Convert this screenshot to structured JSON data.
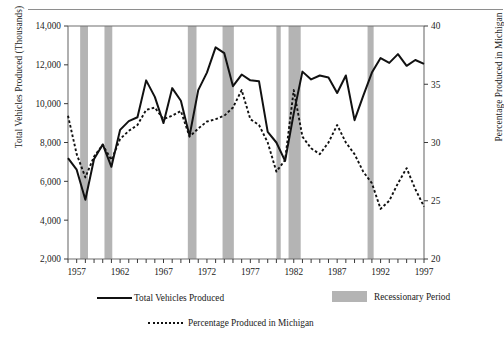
{
  "chart_data": {
    "type": "line",
    "title": "",
    "xlabel": "",
    "ylabel": "Total Vehicles Produced (Thousands)",
    "y2label": "Percentage Produced in Michigan",
    "x": [
      1956,
      1957,
      1958,
      1959,
      1960,
      1961,
      1962,
      1963,
      1964,
      1965,
      1966,
      1967,
      1968,
      1969,
      1970,
      1971,
      1972,
      1973,
      1974,
      1975,
      1976,
      1977,
      1978,
      1979,
      1980,
      1981,
      1982,
      1983,
      1984,
      1985,
      1986,
      1987,
      1988,
      1989,
      1990,
      1991,
      1992,
      1993,
      1994,
      1995,
      1996,
      1997
    ],
    "xlim": [
      1956,
      1997
    ],
    "ylim": [
      2000,
      14000
    ],
    "y2lim": [
      20,
      40
    ],
    "yticks": [
      "2,000",
      "4,000",
      "6,000",
      "8,000",
      "10,000",
      "12,000",
      "14,000"
    ],
    "y2ticks": [
      "20",
      "25",
      "30",
      "35",
      "40"
    ],
    "xticks_labeled": [
      "1957",
      "1962",
      "1967",
      "1972",
      "1977",
      "1982",
      "1987",
      "1992",
      "1997"
    ],
    "xtick_interval_years": 1,
    "grid": false,
    "legend_position": "below",
    "series": [
      {
        "name": "Total Vehicles Produced",
        "axis": "left",
        "style": "solid",
        "color": "#111111",
        "values": [
          7200,
          6600,
          5050,
          7150,
          7900,
          6750,
          8650,
          9100,
          9300,
          11200,
          10350,
          9000,
          10800,
          10150,
          8350,
          10700,
          11600,
          12900,
          12600,
          10900,
          11500,
          11200,
          11150,
          8550,
          8000,
          7050,
          9500,
          11650,
          11250,
          11450,
          11350,
          10550,
          11450,
          9150,
          10400,
          11600,
          12350,
          12100,
          12550,
          11950,
          12250,
          12050
        ],
        "values_description": "Total vehicles produced in thousands, 1956-1997"
      },
      {
        "name": "Percentage Produced in Michigan",
        "axis": "right",
        "style": "dotted",
        "color": "#111111",
        "values": [
          32.3,
          29.0,
          27.0,
          28.8,
          29.8,
          28.5,
          30.3,
          31.0,
          31.5,
          32.8,
          33.0,
          32.0,
          32.3,
          32.7,
          30.5,
          31.2,
          31.8,
          32.0,
          32.3,
          33.0,
          34.5,
          32.0,
          31.5,
          30.0,
          27.5,
          28.5,
          34.5,
          30.5,
          29.5,
          29.0,
          30.0,
          31.5,
          30.0,
          29.0,
          27.5,
          26.5,
          24.3,
          25.0,
          26.5,
          27.8,
          26.0,
          24.5
        ],
        "values_description": "Percentage of total vehicles produced in Michigan, 1956-1997"
      }
    ],
    "shaded_regions": {
      "name": "Recessionary Period",
      "color": "#b4b4b4",
      "periods": [
        {
          "start": 1957.4,
          "end": 1958.3
        },
        {
          "start": 1960.2,
          "end": 1961.1
        },
        {
          "start": 1969.8,
          "end": 1970.8
        },
        {
          "start": 1973.8,
          "end": 1975.1
        },
        {
          "start": 1980.0,
          "end": 1980.5
        },
        {
          "start": 1981.4,
          "end": 1982.8
        },
        {
          "start": 1990.5,
          "end": 1991.2
        }
      ]
    }
  },
  "legend": {
    "total_vehicles_label": "Total Vehicles Produced",
    "recession_label": "Recessionary Period",
    "percentage_label": "Percentage Produced in Michigan"
  },
  "axes": {
    "left_title": "Total Vehicles Produced (Thousands)",
    "right_title": "Percentage Produced in Michigan"
  }
}
